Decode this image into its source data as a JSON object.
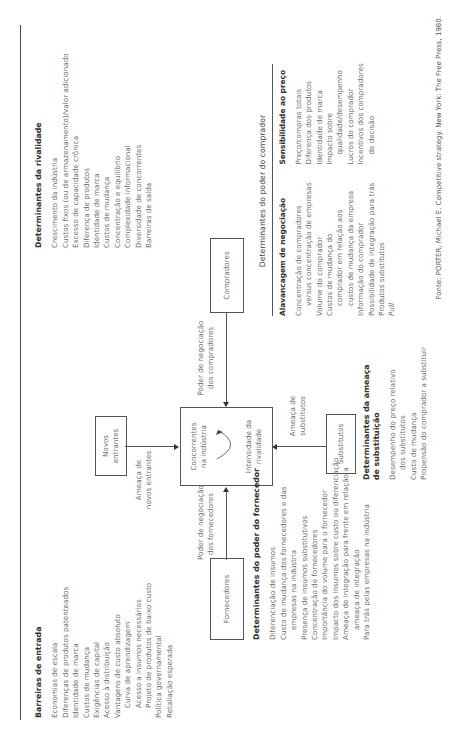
{
  "source": "Fonte: PORTER, Michael E. Competitive strategy. New York: The Free Press, 1980.",
  "entry_barriers": {
    "title": "Barreiras de entrada",
    "items": [
      "Economias de escala",
      "Diferenças de produtos patenteados",
      "Identidade de marca",
      "Custos de mudança",
      "Exigências de capital",
      "Acesso à distribuição",
      "Vantagens de custo absoluto",
      "Curva de aprendizagem",
      "Acesso a insumos necessários",
      "Projeto de produtos de baixo custo",
      "Política governamental",
      "Retaliação esperada"
    ]
  },
  "rivalry_determinants": {
    "title": "Determinantes da rivalidade",
    "items": [
      "Crescimento da indústria",
      "Custos fixos (ou de armazenamento)/valor adicionado",
      "Excesso de capacidade crônica",
      "Diferença de produtos",
      "Identidade de marca",
      "Custos de mudança",
      "Concentração e equilíbrio",
      "Complexidade informacional",
      "Diversidade de concorrentes",
      "Barreiras de saída"
    ]
  },
  "supplier_determinants": {
    "title": "Determinantes do poder do fornecedor",
    "items": [
      "Diferenciação de insumos",
      "Custo de mudança dos fornecedores e das",
      "empresas na indústria",
      "Presença de insumos substitutivos",
      "Concentração de fornecedores",
      "Importância do volume para o fornecedor",
      "Impacto dos insumos sobre custo ou diferenciação",
      "Ameaça de integração para frente em relação a",
      "ameaça de integração",
      "Para trás pelas empresas na indústria"
    ]
  },
  "substitution_determinants": {
    "title_line1": "Determinantes da ameaça",
    "title_line2": "de substituição",
    "items": [
      "Desempenho do preço relativo",
      "dos substitutos",
      "Custo de mudança",
      "Propensão do comprador a substituir"
    ]
  },
  "buyer_determinants": {
    "title": "Determinantes do poder do comprador",
    "leverage": {
      "title": "Alavancagem de negociação",
      "items": [
        "Concentração de compradores",
        "versus concentração de empresas",
        "Volume do comprador",
        "Custos de mudança do",
        "comprador em relação aos",
        "custos de mudança da empresa",
        "Informação do comprador",
        "Possibilidade de integração para trás",
        "Produtos substitutos",
        "Pull"
      ]
    },
    "price_sensitivity": {
      "title": "Sensibilidade ao preço",
      "items": [
        "Preço/compras totais",
        "Diferença dos produtos",
        "Identidade de marca",
        "Impacto sobre",
        "qualidade/desempenho",
        "Lucros do comprador",
        "Incentivos dos compradores",
        "de decisão"
      ]
    }
  },
  "diagram": {
    "new_entrants": {
      "line1": "Novos",
      "line2": "entrantes"
    },
    "new_entrants_arrow": {
      "line1": "Ameaça de",
      "line2": "novos entrantes"
    },
    "competitors": {
      "line1": "Concorrentes",
      "line2": "na indústria",
      "line3": "Intensidade da",
      "line4": "rivalidade"
    },
    "suppliers": {
      "label": "Fornecedores"
    },
    "suppliers_arrow": {
      "line1": "Poder de negociação",
      "line2": "dos fornecedores"
    },
    "buyers": {
      "label": "Compradores"
    },
    "buyers_arrow": {
      "line1": "Poder de negociação",
      "line2": "dos compradores"
    },
    "substitutes": {
      "label": "Substitutos"
    },
    "substitutes_arrow": {
      "line1": "Ameaça de",
      "line2": "substitutos"
    }
  }
}
